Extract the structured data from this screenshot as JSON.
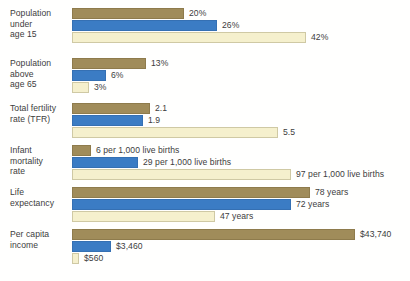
{
  "chart_data": {
    "type": "bar",
    "title": "",
    "xlabel": "",
    "ylabel": "",
    "orientation": "horizontal",
    "grid": false,
    "legend_position": "none",
    "scaling": "per-group-normalized",
    "series": [
      {
        "name": "High income",
        "color": "#a08c5a"
      },
      {
        "name": "Middle income",
        "color": "#3b7cc4"
      },
      {
        "name": "Low income",
        "color": "#f5f0cd"
      }
    ],
    "categories": [
      "Population under age 15",
      "Population above age 65",
      "Total fertility rate (TFR)",
      "Infant mortality rate",
      "Life expectancy",
      "Per capita income"
    ],
    "values": [
      [
        20,
        26,
        42
      ],
      [
        13,
        6,
        3
      ],
      [
        2.1,
        1.9,
        5.5
      ],
      [
        6,
        29,
        97
      ],
      [
        78,
        72,
        47
      ],
      [
        43740,
        3460,
        560
      ]
    ],
    "value_labels": [
      [
        "20%",
        "26%",
        "42%"
      ],
      [
        "13%",
        "6%",
        "3%"
      ],
      [
        "2.1",
        "1.9",
        "5.5"
      ],
      [
        "6 per 1,000 live births",
        "29 per 1,000 live births",
        "97 per 1,000 live births"
      ],
      [
        "78 years",
        "72 years",
        "47 years"
      ],
      [
        "$43,740",
        "$3,460",
        "$560"
      ]
    ]
  },
  "groups": [
    {
      "label_lines": [
        "Population",
        "under",
        "age 15"
      ],
      "bars": [
        {
          "value_label": "20%",
          "width_px": 112
        },
        {
          "value_label": "26%",
          "width_px": 145
        },
        {
          "value_label": "42%",
          "width_px": 234
        }
      ]
    },
    {
      "label_lines": [
        "Population",
        "above",
        "age 65"
      ],
      "bars": [
        {
          "value_label": "13%",
          "width_px": 74
        },
        {
          "value_label": "6%",
          "width_px": 34
        },
        {
          "value_label": "3%",
          "width_px": 17
        }
      ]
    },
    {
      "label_lines": [
        "Total fertility",
        "rate (TFR)"
      ],
      "bars": [
        {
          "value_label": "2.1",
          "width_px": 78
        },
        {
          "value_label": "1.9",
          "width_px": 71
        },
        {
          "value_label": "5.5",
          "width_px": 206
        }
      ]
    },
    {
      "label_lines": [
        "Infant",
        "mortality",
        "rate"
      ],
      "bars": [
        {
          "value_label": "6 per 1,000 live births",
          "width_px": 19
        },
        {
          "value_label": "29 per 1,000 live births",
          "width_px": 66
        },
        {
          "value_label": "97 per 1,000 live births",
          "width_px": 219
        }
      ]
    },
    {
      "label_lines": [
        "Life",
        "expectancy"
      ],
      "bars": [
        {
          "value_label": "78 years",
          "width_px": 238
        },
        {
          "value_label": "72 years",
          "width_px": 219
        },
        {
          "value_label": "47 years",
          "width_px": 143
        }
      ]
    },
    {
      "label_lines": [
        "Per capita",
        "income"
      ],
      "bars": [
        {
          "value_label": "$43,740",
          "width_px": 283
        },
        {
          "value_label": "$3,460",
          "width_px": 39
        },
        {
          "value_label": "$560",
          "width_px": 7
        }
      ]
    }
  ],
  "caption": {
    "text": ""
  }
}
